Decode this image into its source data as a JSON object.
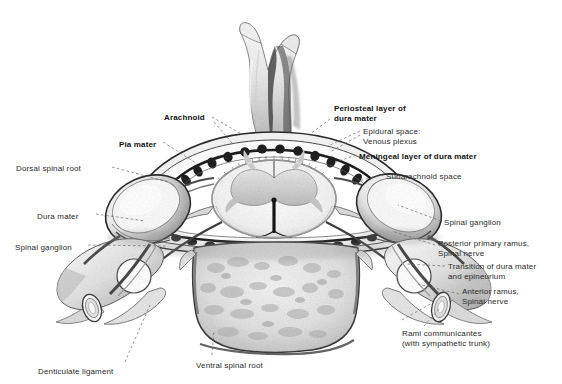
{
  "figure": {
    "background": "#ffffff",
    "ink": "#2b2b2b"
  },
  "labels": [
    {
      "id": "arachnoid",
      "text": "Arachnoid",
      "bold": true,
      "x": 164,
      "y": 113,
      "align": "left"
    },
    {
      "id": "pia-mater",
      "text": "Pia mater",
      "bold": true,
      "x": 119,
      "y": 140,
      "align": "left"
    },
    {
      "id": "periosteal-layer",
      "text": "Periosteal layer of\ndura mater",
      "bold": true,
      "x": 334,
      "y": 104,
      "align": "left"
    },
    {
      "id": "epidural-space",
      "text": "Epidural space:\nVenous plexus",
      "bold": false,
      "x": 363,
      "y": 127,
      "align": "left"
    },
    {
      "id": "meningeal-layer",
      "text": "Meningeal layer of dura mater",
      "bold": true,
      "x": 359,
      "y": 152,
      "align": "left"
    },
    {
      "id": "subarachnoid-space",
      "text": "Subarachnoid space",
      "bold": false,
      "x": 386,
      "y": 172,
      "align": "left"
    },
    {
      "id": "dorsal-spinal-root",
      "text": "Dorsal spinal root",
      "bold": false,
      "x": 16,
      "y": 164,
      "align": "left"
    },
    {
      "id": "dura-mater",
      "text": "Dura mater",
      "bold": false,
      "x": 37,
      "y": 212,
      "align": "left"
    },
    {
      "id": "spinal-ganglion-left",
      "text": "Spinal ganglion",
      "bold": false,
      "x": 15,
      "y": 243,
      "align": "left"
    },
    {
      "id": "spinal-ganglion-right",
      "text": "Spinal ganglion",
      "bold": false,
      "x": 444,
      "y": 218,
      "align": "left"
    },
    {
      "id": "posterior-ramus",
      "text": "Posterior primary ramus,\nSpinal nerve",
      "bold": false,
      "x": 438,
      "y": 239,
      "align": "left"
    },
    {
      "id": "transition-dura",
      "text": "Transition of dura mater\nand epineurium",
      "bold": false,
      "x": 448,
      "y": 262,
      "align": "left"
    },
    {
      "id": "anterior-ramus",
      "text": "Anterior ramus,\nSpinal nerve",
      "bold": false,
      "x": 462,
      "y": 287,
      "align": "left"
    },
    {
      "id": "rami-communicantes",
      "text": "Rami communicantes\n(with sympathetic trunk)",
      "bold": false,
      "x": 402,
      "y": 329,
      "align": "left"
    },
    {
      "id": "denticulate-ligament",
      "text": "Denticulate ligament",
      "bold": false,
      "x": 38,
      "y": 367,
      "align": "left"
    },
    {
      "id": "ventral-spinal-root",
      "text": "Ventral spinal root",
      "bold": false,
      "x": 196,
      "y": 361,
      "align": "left"
    }
  ],
  "leaders": [
    {
      "id": "leader-arachnoid",
      "d": "M 212 117 L 243 135"
    },
    {
      "id": "leader-arachnoid-2",
      "d": "M 214 122 L 232 143"
    },
    {
      "id": "leader-pia",
      "d": "M 163 142 L 196 163"
    },
    {
      "id": "leader-periosteal",
      "d": "M 330 119 L 310 134"
    },
    {
      "id": "leader-epidural",
      "d": "M 360 131 L 328 146"
    },
    {
      "id": "leader-epidural-2",
      "d": "M 360 135 L 330 152"
    },
    {
      "id": "leader-meningeal",
      "d": "M 356 155 L 336 162"
    },
    {
      "id": "leader-subarachnoid",
      "d": "M 383 175 L 358 181"
    },
    {
      "id": "leader-dorsal-root",
      "d": "M 112 167 L 168 182"
    },
    {
      "id": "leader-dura-mater",
      "d": "M 96 214 L 145 221"
    },
    {
      "id": "leader-ganglion-left",
      "d": "M 88 245 L 168 246"
    },
    {
      "id": "leader-ganglion-right",
      "d": "M 441 221 L 398 205"
    },
    {
      "id": "leader-posterior-ramus",
      "d": "M 435 245 L 392 231"
    },
    {
      "id": "leader-transition-dura",
      "d": "M 445 266 L 406 264"
    },
    {
      "id": "leader-anterior-ramus",
      "d": "M 459 294 L 418 284"
    },
    {
      "id": "leader-rami",
      "d": "M 424 326 L 440 308"
    },
    {
      "id": "leader-rami-2",
      "d": "M 402 320 L 432 303"
    },
    {
      "id": "leader-denticulate",
      "d": "M 125 362 L 150 305"
    },
    {
      "id": "leader-ventral-root",
      "d": "M 212 355 L 214 330"
    }
  ],
  "structures": {
    "spinous_process": "bifid cervical spinous process",
    "vertebral_body": "vertebral body with trabecular bone",
    "transverse_foramen": "transverse foramen",
    "spinal_cord": "spinal cord with butterfly gray matter",
    "central_canal": "central canal",
    "venous_plexus": "epidural venous plexus beads",
    "ganglion": "spinal ganglion (dorsal root ganglion)",
    "sympathetic_trunk": "sympathetic trunk nerve bundle"
  }
}
